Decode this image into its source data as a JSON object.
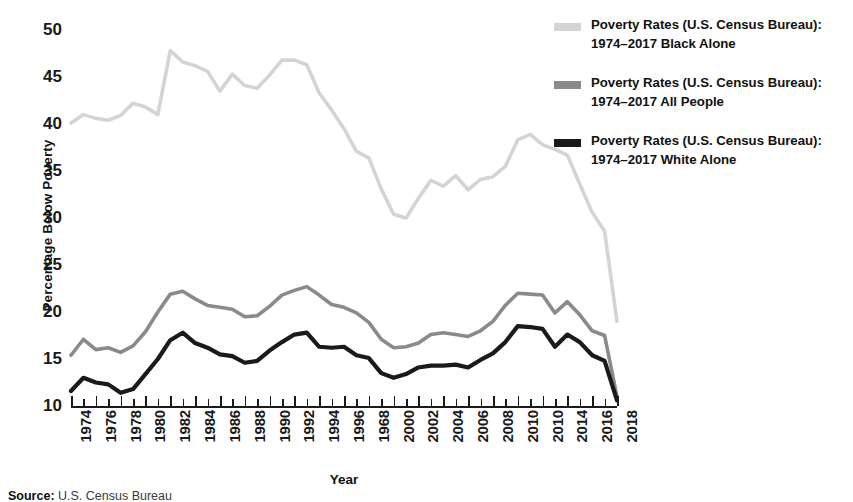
{
  "chart_data": {
    "type": "line",
    "title": "",
    "xlabel": "Year",
    "ylabel": "Percentage Below Poverty",
    "ylim": [
      10,
      50
    ],
    "yticks": [
      10,
      15,
      20,
      25,
      30,
      35,
      40,
      45,
      50
    ],
    "xlim": [
      1974,
      2018
    ],
    "grid": false,
    "legend_position": "top-right",
    "x": [
      1974,
      1975,
      1976,
      1977,
      1978,
      1979,
      1980,
      1981,
      1982,
      1983,
      1984,
      1985,
      1986,
      1987,
      1988,
      1989,
      1990,
      1991,
      1992,
      1993,
      1994,
      1995,
      1996,
      1997,
      1998,
      1999,
      2000,
      2001,
      2002,
      2003,
      2004,
      2005,
      2006,
      2007,
      2008,
      2009,
      2010,
      2011,
      2012,
      2013,
      2014,
      2015,
      2016,
      2017,
      2018
    ],
    "xtick_labels": [
      "1974",
      "1976",
      "1978",
      "1980",
      "1982",
      "1984",
      "1986",
      "1988",
      "1990",
      "1992",
      "1994",
      "1996",
      "1968",
      "2000",
      "2002",
      "2004",
      "2006",
      "2008",
      "2010",
      "2010",
      "2014",
      "2016",
      "2018"
    ],
    "xtick_values": [
      1974,
      1976,
      1978,
      1980,
      1982,
      1984,
      1986,
      1988,
      1990,
      1992,
      1994,
      1996,
      1998,
      2000,
      2002,
      2004,
      2006,
      2008,
      2010,
      2012,
      2014,
      2016,
      2018
    ],
    "series": [
      {
        "name": "Poverty Rates (U.S. Census Bureau): 1974-2017 Black Alone",
        "label_line1": "Poverty Rates (U.S. Census Bureau):",
        "label_line2": "1974–2017 Black Alone",
        "color": "#d4d4d4",
        "values": [
          40.1,
          41.0,
          40.6,
          40.4,
          40.9,
          42.2,
          41.8,
          41.0,
          47.8,
          46.6,
          46.2,
          45.6,
          43.5,
          45.3,
          44.1,
          43.8,
          45.2,
          46.8,
          46.8,
          46.3,
          43.3,
          41.5,
          39.5,
          37.1,
          36.4,
          33.1,
          30.4,
          30.0,
          32.1,
          34.0,
          33.4,
          34.5,
          33.0,
          34.1,
          34.4,
          35.5,
          38.3,
          38.9,
          37.8,
          37.3,
          36.7,
          33.6,
          30.6,
          28.6,
          19.0
        ]
      },
      {
        "name": "Poverty Rates (U.S. Census Bureau): 1974-2017 All People",
        "label_line1": "Poverty Rates (U.S. Census Bureau):",
        "label_line2": "1974–2017 All People",
        "color": "#8a8a8a",
        "values": [
          15.4,
          17.1,
          16.0,
          16.2,
          15.7,
          16.4,
          17.9,
          20.0,
          21.9,
          22.2,
          21.4,
          20.7,
          20.5,
          20.3,
          19.5,
          19.6,
          20.6,
          21.8,
          22.3,
          22.7,
          21.8,
          20.8,
          20.5,
          19.9,
          18.9,
          17.1,
          16.2,
          16.3,
          16.7,
          17.6,
          17.8,
          17.6,
          17.4,
          18.0,
          19.0,
          20.7,
          22.0,
          21.9,
          21.8,
          19.9,
          21.1,
          19.7,
          18.0,
          17.5,
          11.0
        ]
      },
      {
        "name": "Poverty Rates (U.S. Census Bureau): 1974-2017 White Alone",
        "label_line1": "Poverty Rates (U.S. Census Bureau):",
        "label_line2": "1974–2017 White Alone",
        "color": "#1a1a1a",
        "values": [
          11.6,
          13.0,
          12.5,
          12.3,
          11.4,
          11.8,
          13.4,
          15.0,
          17.0,
          17.8,
          16.7,
          16.2,
          15.5,
          15.3,
          14.6,
          14.8,
          15.9,
          16.8,
          17.6,
          17.8,
          16.3,
          16.2,
          16.3,
          15.4,
          15.1,
          13.5,
          13.0,
          13.4,
          14.1,
          14.3,
          14.3,
          14.4,
          14.1,
          14.9,
          15.6,
          16.8,
          18.5,
          18.4,
          18.2,
          16.3,
          17.6,
          16.8,
          15.4,
          14.8,
          10.6
        ]
      }
    ]
  },
  "axes": {
    "y_title": "Percentage Below Poverty",
    "x_title": "Year"
  },
  "source": {
    "label": "Source:",
    "text": " U.S. Census Bureau"
  }
}
